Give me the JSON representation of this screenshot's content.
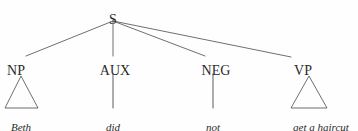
{
  "figure": {
    "type": "syntax-tree",
    "sentence": "Beth did not get a haircut",
    "background_color": "#fefefe",
    "line_color": "#4a4a4a",
    "text_color": "#2b2b2b"
  },
  "root": {
    "label": "S",
    "x": 113,
    "y": 13
  },
  "nodes": [
    {
      "id": "np",
      "label": "NP",
      "x": 16,
      "y": 64,
      "terminal": "Beth",
      "terminal_x": 21,
      "terminal_y": 122,
      "expansion": "triangle",
      "triangle": {
        "apex_x": 21,
        "apex_y": 76,
        "left_x": 5,
        "right_x": 38,
        "base_y": 108
      }
    },
    {
      "id": "aux",
      "label": "AUX",
      "x": 115,
      "y": 64,
      "terminal": "did",
      "terminal_x": 113,
      "terminal_y": 122,
      "expansion": "line",
      "line": {
        "x": 113,
        "y1": 74,
        "y2": 108
      }
    },
    {
      "id": "neg",
      "label": "NEG",
      "x": 216,
      "y": 64,
      "terminal": "not",
      "terminal_x": 213,
      "terminal_y": 122,
      "expansion": "line",
      "line": {
        "x": 213,
        "y1": 74,
        "y2": 108
      }
    },
    {
      "id": "vp",
      "label": "VP",
      "x": 303,
      "y": 64,
      "terminal": "get a haircut",
      "terminal_x": 321,
      "terminal_y": 122,
      "expansion": "triangle",
      "triangle": {
        "apex_x": 309,
        "apex_y": 76,
        "left_x": 291,
        "right_x": 327,
        "base_y": 108
      }
    }
  ],
  "branches": [
    {
      "from": "S",
      "to": "NP",
      "x1": 113,
      "y1": 21,
      "x2": 26,
      "y2": 56
    },
    {
      "from": "S",
      "to": "AUX",
      "x1": 113,
      "y1": 21,
      "x2": 113,
      "y2": 56
    },
    {
      "from": "S",
      "to": "NEG",
      "x1": 113,
      "y1": 21,
      "x2": 205,
      "y2": 56
    },
    {
      "from": "S",
      "to": "VP",
      "x1": 113,
      "y1": 21,
      "x2": 291,
      "y2": 57
    }
  ]
}
